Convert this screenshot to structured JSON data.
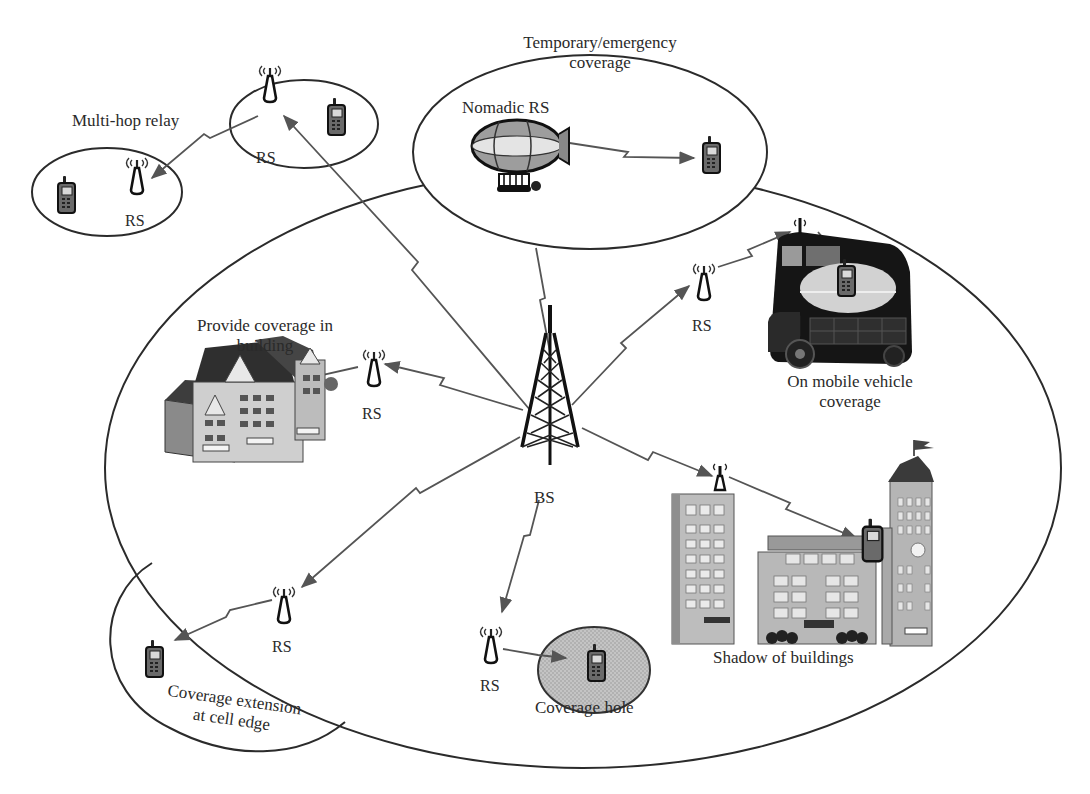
{
  "diagram": {
    "colors": {
      "outline": "#2b2b2b",
      "link": "#555555",
      "coverage_hole_fill": "#bdbdbd",
      "vehicle_window_fill": "#d2d2d2",
      "background": "#ffffff"
    },
    "nodes": {
      "bs": {
        "label": "BS",
        "icon": "cell-tower-icon"
      },
      "rs_multihop_upper": {
        "label": "RS",
        "icon": "relay-antenna-icon"
      },
      "rs_multihop_lower": {
        "label": "RS",
        "icon": "relay-antenna-icon"
      },
      "rs_building": {
        "label": "RS",
        "icon": "relay-antenna-icon"
      },
      "rs_vehicle": {
        "label": "RS",
        "icon": "relay-antenna-icon"
      },
      "rs_cell_edge": {
        "label": "RS",
        "icon": "relay-antenna-icon"
      },
      "rs_coverage_hole": {
        "label": "RS",
        "icon": "relay-antenna-icon"
      },
      "nomadic_rs": {
        "label": "Nomadic RS",
        "icon": "airship-icon"
      }
    },
    "scenarios": {
      "multi_hop": {
        "label": "Multi-hop relay"
      },
      "temporary": {
        "line1": "Temporary/emergency",
        "line2": "coverage"
      },
      "building": {
        "line1": "Provide coverage in",
        "line2": "building"
      },
      "vehicle": {
        "line1": "On mobile vehicle",
        "line2": "coverage"
      },
      "shadow": {
        "label": "Shadow of buildings"
      },
      "coverage_hole": {
        "label": "Coverage hole"
      },
      "cell_edge": {
        "line1": "Coverage extension",
        "line2": "at cell edge"
      }
    },
    "links": [
      {
        "from": "BS",
        "to": "RS (multi-hop upper)"
      },
      {
        "from": "RS (multi-hop upper)",
        "to": "RS (multi-hop lower)"
      },
      {
        "from": "BS",
        "to": "Nomadic RS"
      },
      {
        "from": "Nomadic RS",
        "to": "Mobile station"
      },
      {
        "from": "BS",
        "to": "RS (building)"
      },
      {
        "from": "RS (building)",
        "to": "Building"
      },
      {
        "from": "BS",
        "to": "RS (vehicle)"
      },
      {
        "from": "RS (vehicle)",
        "to": "Bus antenna"
      },
      {
        "from": "Bus antenna",
        "to": "Mobile station in bus"
      },
      {
        "from": "BS",
        "to": "Rooftop RS"
      },
      {
        "from": "Rooftop RS",
        "to": "Mobile station behind buildings"
      },
      {
        "from": "BS",
        "to": "RS (coverage hole)"
      },
      {
        "from": "RS (coverage hole)",
        "to": "Mobile station in hole"
      },
      {
        "from": "BS",
        "to": "RS (cell edge)"
      },
      {
        "from": "RS (cell edge)",
        "to": "Mobile station at cell edge"
      }
    ]
  }
}
